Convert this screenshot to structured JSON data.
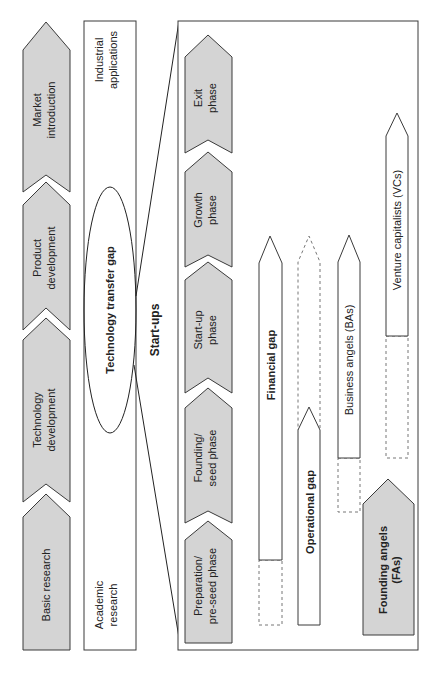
{
  "diagram": {
    "innovation_stages": [
      {
        "label": "Basic research"
      },
      {
        "label": "Technology development"
      },
      {
        "label": "Product development"
      },
      {
        "label": "Market introduction"
      }
    ],
    "research_bar": {
      "start_label": "Academic research",
      "end_label": "Industrial applications",
      "gap_label": "Technology transfer gap"
    },
    "startups_label": "Start-ups",
    "startup_phases": [
      {
        "label": "Preparation/ pre-seed phase"
      },
      {
        "label": "Founding/ seed phase"
      },
      {
        "label": "Start-up phase"
      },
      {
        "label": "Growth phase"
      },
      {
        "label": "Exit phase"
      }
    ],
    "gaps": {
      "financial": "Financial gap",
      "operational": "Operational gap"
    },
    "investors": {
      "business_angels": "Business angels (BAs)",
      "venture_capitalists": "Venture capitalists (VCs)",
      "founding_angels": "Founding angels (FAs)"
    },
    "colors": {
      "stage_fill": "#d4d4d4",
      "outline": "#3a3a3a",
      "background": "#ffffff"
    }
  }
}
